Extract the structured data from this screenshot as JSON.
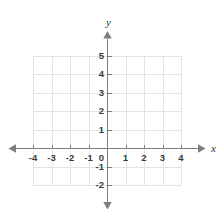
{
  "figure": {
    "kind": "cartesian-coordinate-grid",
    "width": 219,
    "height": 209,
    "background_color": "#ffffff"
  },
  "chart_data": {
    "type": "scatter",
    "title": "",
    "subtitle": "",
    "xlabel": "x",
    "ylabel": "y",
    "xlim": [
      -4,
      4
    ],
    "ylim": [
      -2,
      5
    ],
    "x_ticks": [
      -4,
      -3,
      -2,
      -1,
      0,
      1,
      2,
      3,
      4
    ],
    "y_ticks": [
      -2,
      -1,
      0,
      1,
      2,
      3,
      4,
      5
    ],
    "x_tick_labels": [
      "-4",
      "-3",
      "-2",
      "-1",
      "0",
      "1",
      "2",
      "3",
      "4"
    ],
    "y_tick_labels": [
      "-2",
      "-1",
      "",
      "1",
      "2",
      "3",
      "4",
      "5"
    ],
    "origin_label": "0",
    "grid": true,
    "grid_spacing": 1,
    "legend": false,
    "legend_position": "none",
    "series": [],
    "annotations": [],
    "x": [],
    "values": []
  },
  "axes": {
    "x_axis_name": "x",
    "y_axis_name": "y",
    "axis_color": "#7d7d7d",
    "grid_color": "#e3e3e3",
    "label_color": "#3a3a3a",
    "arrowheads": [
      "left",
      "right",
      "up",
      "down"
    ]
  },
  "geometry": {
    "origin_x": 107,
    "origin_y": 148,
    "unit_px": 18.5,
    "grid_left_unit": -4,
    "grid_right_unit": 4,
    "grid_top_unit": 5,
    "grid_bottom_unit": -2,
    "axis_overshoot_px": 17
  }
}
